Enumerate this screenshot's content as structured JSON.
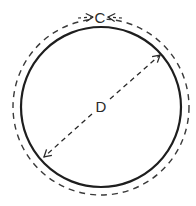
{
  "diagram": {
    "title": "",
    "labels": {
      "circumference": "C",
      "diameter": "D"
    },
    "colors": {
      "stroke": "#1e1e1e",
      "dashed": "#3a3a3a",
      "background": "#ffffff"
    },
    "geometry": {
      "center": [
        101,
        107
      ],
      "solid_radius": 80,
      "dashed_radius": 88,
      "diameter_start": [
        43,
        158
      ],
      "diameter_end": [
        161,
        54
      ]
    },
    "elements": [
      {
        "type": "circle",
        "style": "solid",
        "meaning": "circle outline"
      },
      {
        "type": "circle",
        "style": "dashed",
        "meaning": "circumference indicator",
        "label": "C"
      },
      {
        "type": "double-arrow",
        "style": "dashed",
        "meaning": "diameter",
        "label": "D"
      }
    ]
  }
}
